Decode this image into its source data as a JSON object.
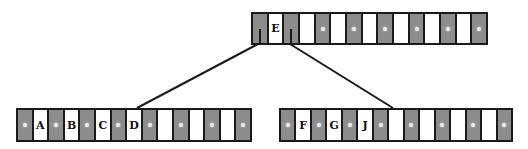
{
  "diagram": {
    "type": "b-tree",
    "colors": {
      "pointer_cell": "#8c8c8c",
      "key_cell": "#ffffff",
      "border": "#1a1a1a",
      "null_dot": "#e8e8e8"
    },
    "nodes": [
      {
        "id": "root",
        "x": 251,
        "y": 12,
        "w": 237,
        "h": 33,
        "cells": [
          {
            "kind": "ptr",
            "state": "link"
          },
          {
            "kind": "key",
            "label": "E"
          },
          {
            "kind": "ptr",
            "state": "link"
          },
          {
            "kind": "key",
            "label": ""
          },
          {
            "kind": "ptr",
            "state": "null"
          },
          {
            "kind": "key",
            "label": ""
          },
          {
            "kind": "ptr",
            "state": "null"
          },
          {
            "kind": "key",
            "label": ""
          },
          {
            "kind": "ptr",
            "state": "null"
          },
          {
            "kind": "key",
            "label": ""
          },
          {
            "kind": "ptr",
            "state": "null"
          },
          {
            "kind": "key",
            "label": ""
          },
          {
            "kind": "ptr",
            "state": "null"
          },
          {
            "kind": "key",
            "label": ""
          },
          {
            "kind": "ptr",
            "state": "null"
          }
        ]
      },
      {
        "id": "left",
        "x": 16,
        "y": 108,
        "w": 236,
        "h": 34,
        "cells": [
          {
            "kind": "ptr",
            "state": "null"
          },
          {
            "kind": "key",
            "label": "A"
          },
          {
            "kind": "ptr",
            "state": "null"
          },
          {
            "kind": "key",
            "label": "B"
          },
          {
            "kind": "ptr",
            "state": "null"
          },
          {
            "kind": "key",
            "label": "C"
          },
          {
            "kind": "ptr",
            "state": "null"
          },
          {
            "kind": "key",
            "label": "D"
          },
          {
            "kind": "ptr",
            "state": "null"
          },
          {
            "kind": "key",
            "label": ""
          },
          {
            "kind": "ptr",
            "state": "null"
          },
          {
            "kind": "key",
            "label": ""
          },
          {
            "kind": "ptr",
            "state": "null"
          },
          {
            "kind": "key",
            "label": ""
          },
          {
            "kind": "ptr",
            "state": "null"
          }
        ]
      },
      {
        "id": "right",
        "x": 279,
        "y": 108,
        "w": 234,
        "h": 34,
        "cells": [
          {
            "kind": "ptr",
            "state": "null"
          },
          {
            "kind": "key",
            "label": "F"
          },
          {
            "kind": "ptr",
            "state": "null"
          },
          {
            "kind": "key",
            "label": "G"
          },
          {
            "kind": "ptr",
            "state": "null"
          },
          {
            "kind": "key",
            "label": "J"
          },
          {
            "kind": "ptr",
            "state": "null"
          },
          {
            "kind": "key",
            "label": ""
          },
          {
            "kind": "ptr",
            "state": "null"
          },
          {
            "kind": "key",
            "label": ""
          },
          {
            "kind": "ptr",
            "state": "null"
          },
          {
            "kind": "key",
            "label": ""
          },
          {
            "kind": "ptr",
            "state": "null"
          },
          {
            "kind": "key",
            "label": ""
          },
          {
            "kind": "ptr",
            "state": "null"
          }
        ]
      }
    ],
    "edges": [
      {
        "from": "root.0",
        "to": "left",
        "x1": 258,
        "y1": 44,
        "x2": 137,
        "y2": 108
      },
      {
        "from": "root.2",
        "to": "right",
        "x1": 290,
        "y1": 44,
        "x2": 393,
        "y2": 108
      }
    ]
  }
}
